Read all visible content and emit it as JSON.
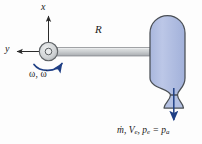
{
  "figure": {
    "background_color": "#fdfdfd"
  },
  "axes": {
    "x_label": "x",
    "y_label": "y",
    "x_direction": "up",
    "y_direction": "left",
    "origin_marker": "o"
  },
  "arm": {
    "radius_label": "R",
    "color": "#c9ccce",
    "outline_color": "#6f7376"
  },
  "rotation": {
    "label": "ω, ω̇",
    "omega": "ω",
    "omega_dot": "ω̇",
    "arrow_color": "#1f3f85",
    "arrow_direction": "counterclockwise-curved"
  },
  "hub": {
    "name": "pivot-hub",
    "fill": "#d2d5d7",
    "outline": "#5e6265",
    "center_label": "o"
  },
  "tank": {
    "name": "propellant-tank",
    "fill": "#b3c0e2",
    "outline": "#4a4f55",
    "shape": "rounded-capsule"
  },
  "nozzle": {
    "name": "converging-diverging-nozzle",
    "fill": "#b3c0e2",
    "outline": "#4a4f55"
  },
  "exhaust": {
    "label": "ṁ, V",
    "label_full": "ṁ, Vₑ, pₑ = pₐ",
    "mass_flow": "ṁ",
    "exit_velocity": "V",
    "exit_velocity_sub": "e",
    "exit_pressure": "p",
    "exit_pressure_sub": "e",
    "ambient_pressure": "p",
    "ambient_pressure_sub": "a",
    "equals": "=",
    "comma": ",",
    "arrow_color": "#1f3f85",
    "arrow_direction": "down"
  }
}
